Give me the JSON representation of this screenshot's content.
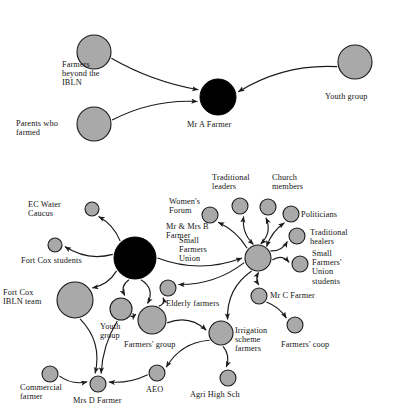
{
  "figure": {
    "type": "social-network-diagram",
    "background": "#ffffff",
    "node_fill_grey": "#a9a9a9",
    "node_fill_black": "#000000",
    "edge_color": "#1b1b1b"
  },
  "diagrams": [
    {
      "id": "upper",
      "name": "Mr A Farmer ego network",
      "nodes": [
        {
          "id": "farmers-beyond-ibln",
          "label": "Farmers\nbeyond the\nIBLN",
          "cx": 94,
          "cy": 52,
          "r": 17,
          "fill": "grey",
          "label_x": 62,
          "label_y": 60,
          "align": "left"
        },
        {
          "id": "parents-who-farmed",
          "label": "Parents who\nfarmed",
          "cx": 94,
          "cy": 124,
          "r": 17,
          "fill": "grey",
          "label_x": 16,
          "label_y": 119,
          "align": "left"
        },
        {
          "id": "mr-a-farmer",
          "label": "Mr A Farmer",
          "cx": 218,
          "cy": 97,
          "r": 18,
          "fill": "black",
          "label_x": 187,
          "label_y": 120,
          "align": "left"
        },
        {
          "id": "youth-group-upper",
          "label": "Youth group",
          "cx": 355,
          "cy": 62,
          "r": 17,
          "fill": "grey",
          "label_x": 325,
          "label_y": 92,
          "align": "left"
        }
      ],
      "edges": [
        {
          "from": "farmers-beyond-ibln",
          "to": "mr-a-farmer",
          "arrow": "to"
        },
        {
          "from": "parents-who-farmed",
          "to": "mr-a-farmer",
          "arrow": "to"
        },
        {
          "from": "youth-group-upper",
          "to": "mr-a-farmer",
          "arrow": "to"
        }
      ]
    },
    {
      "id": "lower",
      "name": "Small Farmers Union network",
      "nodes": [
        {
          "id": "ec-water-caucus",
          "label": "EC Water\nCaucus",
          "cx": 92,
          "cy": 209,
          "r": 7,
          "fill": "grey",
          "label_x": 28,
          "label_y": 200,
          "align": "left"
        },
        {
          "id": "fort-cox-students",
          "label": "Fort Cox students",
          "cx": 55,
          "cy": 245,
          "r": 7,
          "fill": "grey",
          "label_x": 21,
          "label_y": 256,
          "align": "left"
        },
        {
          "id": "mr-mrs-b-farmer",
          "label": "Mr & Mrs B\nFarmer",
          "cx": 135,
          "cy": 258,
          "r": 21,
          "fill": "black",
          "label_x": 166,
          "label_y": 222,
          "align": "left"
        },
        {
          "id": "fort-cox-ibln-team",
          "label": "Fort Cox\nIBLN team",
          "cx": 75,
          "cy": 300,
          "r": 18,
          "fill": "grey",
          "label_x": 3,
          "label_y": 288,
          "align": "left"
        },
        {
          "id": "womens-forum",
          "label": "Women's\nForum",
          "cx": 210,
          "cy": 215,
          "r": 8,
          "fill": "grey",
          "label_x": 169,
          "label_y": 197,
          "align": "left"
        },
        {
          "id": "traditional-leaders",
          "label": "Traditional\nleaders",
          "cx": 240,
          "cy": 206,
          "r": 8,
          "fill": "grey",
          "label_x": 212,
          "label_y": 173,
          "align": "left"
        },
        {
          "id": "church-members",
          "label": "Church\nmembers",
          "cx": 268,
          "cy": 207,
          "r": 8,
          "fill": "grey",
          "label_x": 272,
          "label_y": 173,
          "align": "left"
        },
        {
          "id": "politicians",
          "label": "Politicians",
          "cx": 291,
          "cy": 214,
          "r": 8,
          "fill": "grey",
          "label_x": 301,
          "label_y": 210,
          "align": "left"
        },
        {
          "id": "traditional-healers",
          "label": "Traditional\nhealers",
          "cx": 297,
          "cy": 236,
          "r": 8,
          "fill": "grey",
          "label_x": 310,
          "label_y": 228,
          "align": "left"
        },
        {
          "id": "small-farmers-union",
          "label": "Small\nFarmers\nUnion",
          "cx": 258,
          "cy": 258,
          "r": 13,
          "fill": "grey",
          "label_x": 179,
          "label_y": 236,
          "align": "left"
        },
        {
          "id": "sfu-students",
          "label": "Small\nFarmers'\nUnion\nstudents",
          "cx": 300,
          "cy": 264,
          "r": 8,
          "fill": "grey",
          "label_x": 312,
          "label_y": 249,
          "align": "left"
        },
        {
          "id": "mr-c-farmer",
          "label": "Mr C Farmer",
          "cx": 259,
          "cy": 296,
          "r": 8,
          "fill": "grey",
          "label_x": 270,
          "label_y": 291,
          "align": "left"
        },
        {
          "id": "farmers-coop",
          "label": "Farmers' coop",
          "cx": 295,
          "cy": 325,
          "r": 8,
          "fill": "grey",
          "label_x": 281,
          "label_y": 340,
          "align": "left"
        },
        {
          "id": "elderly-farmers",
          "label": "Elderly farmers",
          "cx": 168,
          "cy": 288,
          "r": 8,
          "fill": "grey",
          "label_x": 166,
          "label_y": 299,
          "align": "left"
        },
        {
          "id": "youth-group-lower",
          "label": "Youth\ngroup",
          "cx": 121,
          "cy": 309,
          "r": 11,
          "fill": "grey",
          "label_x": 100,
          "label_y": 322,
          "align": "left"
        },
        {
          "id": "farmers-group",
          "label": "Farmers' group",
          "cx": 152,
          "cy": 320,
          "r": 14,
          "fill": "grey",
          "label_x": 124,
          "label_y": 340,
          "align": "left"
        },
        {
          "id": "irrigation-scheme-farmers",
          "label": "Irrigation\nscheme\nfarmers",
          "cx": 221,
          "cy": 333,
          "r": 12,
          "fill": "grey",
          "label_x": 235,
          "label_y": 326,
          "align": "left"
        },
        {
          "id": "agri-high-sch",
          "label": "Agri High Sch",
          "cx": 228,
          "cy": 378,
          "r": 8,
          "fill": "grey",
          "label_x": 190,
          "label_y": 390,
          "align": "left"
        },
        {
          "id": "aeo",
          "label": "AEO",
          "cx": 157,
          "cy": 373,
          "r": 8,
          "fill": "grey",
          "label_x": 146,
          "label_y": 385,
          "align": "left"
        },
        {
          "id": "mrs-d-farmer",
          "label": "Mrs D Farmer",
          "cx": 98,
          "cy": 384,
          "r": 8,
          "fill": "grey",
          "label_x": 73,
          "label_y": 396,
          "align": "left"
        },
        {
          "id": "commercial-farmer",
          "label": "Commercial\nfarmer",
          "cx": 50,
          "cy": 374,
          "r": 8,
          "fill": "grey",
          "label_x": 20,
          "label_y": 383,
          "align": "left"
        }
      ],
      "edges": [
        {
          "from": "mr-mrs-b-farmer",
          "to": "ec-water-caucus",
          "arrow": "to"
        },
        {
          "from": "mr-mrs-b-farmer",
          "to": "fort-cox-students",
          "arrow": "to"
        },
        {
          "from": "mr-mrs-b-farmer",
          "to": "small-farmers-union",
          "arrow": "to"
        },
        {
          "from": "mr-mrs-b-farmer",
          "to": "fort-cox-ibln-team",
          "arrow": "to"
        },
        {
          "from": "mr-mrs-b-farmer",
          "to": "youth-group-lower",
          "arrow": "to"
        },
        {
          "from": "mr-mrs-b-farmer",
          "to": "farmers-group",
          "arrow": "to"
        },
        {
          "from": "small-farmers-union",
          "to": "womens-forum",
          "arrow": "to"
        },
        {
          "from": "small-farmers-union",
          "to": "traditional-leaders",
          "arrow": "both"
        },
        {
          "from": "small-farmers-union",
          "to": "church-members",
          "arrow": "both"
        },
        {
          "from": "small-farmers-union",
          "to": "politicians",
          "arrow": "both"
        },
        {
          "from": "small-farmers-union",
          "to": "traditional-healers",
          "arrow": "to"
        },
        {
          "from": "small-farmers-union",
          "to": "sfu-students",
          "arrow": "to"
        },
        {
          "from": "small-farmers-union",
          "to": "mr-c-farmer",
          "arrow": "both"
        },
        {
          "from": "small-farmers-union",
          "to": "elderly-farmers",
          "arrow": "to"
        },
        {
          "from": "small-farmers-union",
          "to": "irrigation-scheme-farmers",
          "arrow": "to"
        },
        {
          "from": "mr-c-farmer",
          "to": "farmers-coop",
          "arrow": "to"
        },
        {
          "from": "farmers-group",
          "to": "elderly-farmers",
          "arrow": "to"
        },
        {
          "from": "farmers-group",
          "to": "irrigation-scheme-farmers",
          "arrow": "to"
        },
        {
          "from": "youth-group-lower",
          "to": "farmers-group",
          "arrow": "to"
        },
        {
          "from": "irrigation-scheme-farmers",
          "to": "agri-high-sch",
          "arrow": "to"
        },
        {
          "from": "irrigation-scheme-farmers",
          "to": "aeo",
          "arrow": "to"
        },
        {
          "from": "aeo",
          "to": "mrs-d-farmer",
          "arrow": "to"
        },
        {
          "from": "commercial-farmer",
          "to": "mrs-d-farmer",
          "arrow": "to"
        },
        {
          "from": "fort-cox-ibln-team",
          "to": "mrs-d-farmer",
          "arrow": "to"
        },
        {
          "from": "youth-group-lower",
          "to": "mrs-d-farmer",
          "arrow": "to"
        }
      ]
    }
  ]
}
